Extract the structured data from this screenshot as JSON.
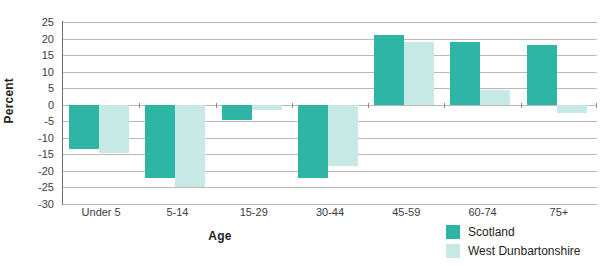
{
  "chart_data": {
    "type": "bar",
    "title": "",
    "xlabel": "Age",
    "ylabel": "Percent",
    "ylim": [
      -30,
      25
    ],
    "yticks": [
      25,
      20,
      15,
      10,
      5,
      0,
      -5,
      -10,
      -15,
      -20,
      -25,
      -30
    ],
    "ytick_labels": [
      "25",
      "20",
      "15",
      "10",
      "5",
      "0",
      "-5",
      "-10",
      "-15",
      "-20",
      "-25",
      "-30"
    ],
    "grid": true,
    "legend_position": "bottom-right",
    "categories": [
      "Under 5",
      "5-14",
      "15-29",
      "30-44",
      "45-59",
      "60-74",
      "75+"
    ],
    "series": [
      {
        "name": "Scotland",
        "color": "#2eb5a5",
        "values": [
          -13.5,
          -22.0,
          -4.5,
          -22.0,
          21.0,
          19.0,
          18.0
        ]
      },
      {
        "name": "West Dunbartonshire",
        "color": "#c6e9e5",
        "values": [
          -14.5,
          -25.0,
          -1.5,
          -18.5,
          19.0,
          4.5,
          -2.5
        ]
      }
    ]
  },
  "axes": {
    "y_title": "Percent",
    "x_title": "Age"
  },
  "legend": {
    "items": [
      {
        "label": "Scotland",
        "color": "#2eb5a5"
      },
      {
        "label": "West Dunbartonshire",
        "color": "#c6e9e5"
      }
    ]
  },
  "colors": {
    "scotland": "#2eb5a5",
    "west_dunbartonshire": "#c6e9e5",
    "gridline": "#b9b9b9",
    "axis": "#6f6f6f",
    "text": "#1d1d1b",
    "tick_text": "#3c3c3b",
    "background": "#ffffff"
  }
}
